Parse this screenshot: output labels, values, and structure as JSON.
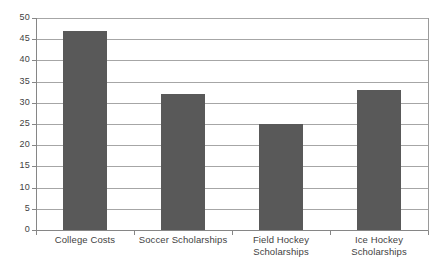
{
  "chart_data": {
    "type": "bar",
    "title": "",
    "subtitle": "",
    "xlabel": "",
    "ylabel": "",
    "categories": [
      "College Costs",
      "Field Hockey\nScholarships",
      "Soccer Scholarships",
      "Ice Hockey Scholarships"
    ],
    "category_labels": [
      {
        "line1": "College Costs",
        "line2": ""
      },
      {
        "line1": "Soccer Scholarships",
        "line2": ""
      },
      {
        "line1": "Field Hockey",
        "line2": "Scholarships"
      },
      {
        "line1": "Ice Hockey Scholarships",
        "line2": ""
      }
    ],
    "values": [
      47,
      32,
      25,
      33
    ],
    "ylim": [
      0,
      50
    ],
    "ytick_values": [
      0,
      5,
      10,
      15,
      20,
      25,
      30,
      35,
      40,
      45,
      50
    ],
    "ytick_labels": [
      "0",
      "5",
      "10",
      "15",
      "20",
      "25",
      "30",
      "35",
      "40",
      "45",
      "50"
    ],
    "grid": true,
    "legend": false,
    "legend_position": "none",
    "bar_color": "#595959",
    "gridline_color": "#a6a6a6",
    "axis_color": "#868686",
    "background_color": "#ffffff",
    "text_color": "#3f3f3f"
  }
}
